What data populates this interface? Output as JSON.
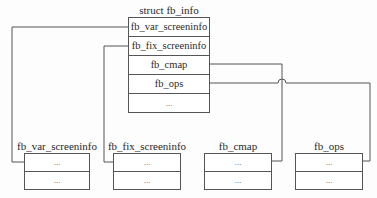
{
  "main_struct": {
    "title": "struct fb_info",
    "fields": [
      "fb_var_screeninfo",
      "fb_fix_screeninfo",
      "fb_cmap",
      "fb_ops",
      "..."
    ]
  },
  "sub_structs": [
    {
      "title": "fb_var_screeninfo",
      "rows": [
        "...",
        "..."
      ]
    },
    {
      "title": "fb_fix_screeninfo",
      "rows": [
        "...",
        "..."
      ]
    },
    {
      "title": "fb_cmap",
      "rows": [
        "...",
        "..."
      ]
    },
    {
      "title": "fb_ops",
      "rows": [
        "...",
        "..."
      ]
    }
  ],
  "colors": {
    "line": "#555555",
    "text": "#2a2a2a",
    "background": "#fdfdfd"
  }
}
